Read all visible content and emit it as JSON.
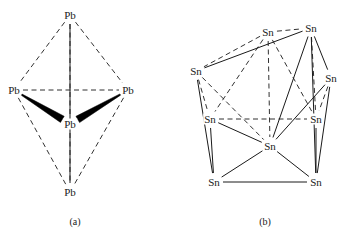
{
  "figure": {
    "background_color": "#ffffff",
    "line_color": "#1a1a1a",
    "wedge_color": "#000000",
    "panels": [
      {
        "id": "panel-a",
        "caption": "(a)",
        "caption_pos": [
          75,
          222
        ],
        "element_symbol": "Pb",
        "atoms": [
          {
            "id": "pb-apex",
            "label": "Pb",
            "x": 70,
            "y": 15
          },
          {
            "id": "pb-left",
            "label": "Pb",
            "x": 14,
            "y": 90
          },
          {
            "id": "pb-right",
            "label": "Pb",
            "x": 128,
            "y": 90
          },
          {
            "id": "pb-center",
            "label": "Pb",
            "x": 70,
            "y": 124
          },
          {
            "id": "pb-bottom",
            "label": "Pb",
            "x": 70,
            "y": 192
          }
        ],
        "bonds": [
          {
            "from": "pb-apex",
            "to": "pb-left",
            "style": "dashed"
          },
          {
            "from": "pb-apex",
            "to": "pb-right",
            "style": "dashed"
          },
          {
            "from": "pb-apex",
            "to": "pb-center",
            "style": "dashed"
          },
          {
            "from": "pb-left",
            "to": "pb-right",
            "style": "dashed"
          },
          {
            "from": "pb-left",
            "to": "pb-bottom",
            "style": "dashed"
          },
          {
            "from": "pb-right",
            "to": "pb-bottom",
            "style": "dashed"
          },
          {
            "from": "pb-center",
            "to": "pb-bottom",
            "style": "dashed"
          },
          {
            "from": "pb-apex",
            "to": "pb-bottom",
            "style": "solid"
          },
          {
            "from": "pb-left",
            "to": "pb-center",
            "style": "wedge"
          },
          {
            "from": "pb-right",
            "to": "pb-center",
            "style": "wedge"
          }
        ]
      },
      {
        "id": "panel-b",
        "caption": "(b)",
        "caption_pos": [
          265,
          222
        ],
        "element_symbol": "Sn",
        "atoms": [
          {
            "id": "sn-top-left",
            "label": "Sn",
            "x": 268,
            "y": 32
          },
          {
            "id": "sn-top-right",
            "label": "Sn",
            "x": 311,
            "y": 28
          },
          {
            "id": "sn-upper-left",
            "label": "Sn",
            "x": 196,
            "y": 71
          },
          {
            "id": "sn-upper-right",
            "label": "Sn",
            "x": 331,
            "y": 78
          },
          {
            "id": "sn-mid-left",
            "label": "Sn",
            "x": 210,
            "y": 119
          },
          {
            "id": "sn-mid-right",
            "label": "Sn",
            "x": 316,
            "y": 119
          },
          {
            "id": "sn-center",
            "label": "Sn",
            "x": 270,
            "y": 146
          },
          {
            "id": "sn-low-left",
            "label": "Sn",
            "x": 214,
            "y": 182
          },
          {
            "id": "sn-low-right",
            "label": "Sn",
            "x": 316,
            "y": 182
          }
        ],
        "bonds": [
          {
            "from": "sn-top-left",
            "to": "sn-top-right",
            "style": "dashed"
          },
          {
            "from": "sn-top-left",
            "to": "sn-upper-left",
            "style": "dashed"
          },
          {
            "from": "sn-top-left",
            "to": "sn-mid-left",
            "style": "dashed"
          },
          {
            "from": "sn-top-left",
            "to": "sn-center",
            "style": "dashed"
          },
          {
            "from": "sn-top-left",
            "to": "sn-mid-right",
            "style": "dashed"
          },
          {
            "from": "sn-top-right",
            "to": "sn-upper-left",
            "style": "solid"
          },
          {
            "from": "sn-top-right",
            "to": "sn-upper-right",
            "style": "solid"
          },
          {
            "from": "sn-top-right",
            "to": "sn-mid-right",
            "style": "dashed"
          },
          {
            "from": "sn-top-right",
            "to": "sn-center",
            "style": "solid"
          },
          {
            "from": "sn-top-right",
            "to": "sn-low-right",
            "style": "solid"
          },
          {
            "from": "sn-upper-left",
            "to": "sn-mid-left",
            "style": "dashed"
          },
          {
            "from": "sn-upper-left",
            "to": "sn-center",
            "style": "dashed"
          },
          {
            "from": "sn-upper-left",
            "to": "sn-low-left",
            "style": "solid"
          },
          {
            "from": "sn-upper-right",
            "to": "sn-mid-right",
            "style": "dashed"
          },
          {
            "from": "sn-upper-right",
            "to": "sn-center",
            "style": "solid"
          },
          {
            "from": "sn-upper-right",
            "to": "sn-low-right",
            "style": "solid"
          },
          {
            "from": "sn-mid-left",
            "to": "sn-mid-right",
            "style": "dashed"
          },
          {
            "from": "sn-mid-left",
            "to": "sn-low-left",
            "style": "solid"
          },
          {
            "from": "sn-mid-left",
            "to": "sn-center",
            "style": "solid"
          },
          {
            "from": "sn-mid-right",
            "to": "sn-low-right",
            "style": "solid"
          },
          {
            "from": "sn-center",
            "to": "sn-low-left",
            "style": "solid"
          },
          {
            "from": "sn-center",
            "to": "sn-low-right",
            "style": "solid"
          },
          {
            "from": "sn-low-left",
            "to": "sn-low-right",
            "style": "solid"
          }
        ]
      }
    ]
  }
}
